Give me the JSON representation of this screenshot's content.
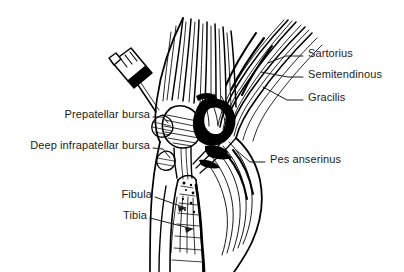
{
  "figure": {
    "background_color": "#ffffff",
    "ink_color": "#000000",
    "label_color": "#1b1b1b",
    "width": 404,
    "height": 272,
    "style": "black-and-white pen-and-ink line art"
  },
  "labels": {
    "sartorius": "Sartorius",
    "semitendinous": "Semitendinous",
    "gracilis": "Gracilis",
    "pes_anserinus": "Pes anserinus",
    "prepatellar_bursa": "Prepatellar bursa",
    "deep_infrapatellar_bursa": "Deep infrapatellar bursa",
    "fibula": "Fibula",
    "tibia": "Tibia"
  },
  "annotations": [
    {
      "id": "sartorius",
      "text": "Sartorius",
      "side": "right",
      "x": 308,
      "y": 52
    },
    {
      "id": "semitendinous",
      "text": "Semitendinous",
      "side": "right",
      "x": 308,
      "y": 73
    },
    {
      "id": "gracilis",
      "text": "Gracilis",
      "side": "right",
      "x": 308,
      "y": 96
    },
    {
      "id": "pes_anserinus",
      "text": "Pes anserinus",
      "side": "right",
      "x": 268,
      "y": 158
    },
    {
      "id": "prepatellar_bursa",
      "text": "Prepatellar bursa",
      "side": "left",
      "x": 60,
      "y": 113
    },
    {
      "id": "deep_infrapatellar_bursa",
      "text": "Deep infrapatellar bursa",
      "side": "left",
      "x": 20,
      "y": 144
    },
    {
      "id": "fibula",
      "text": "Fibula",
      "side": "left",
      "x": 120,
      "y": 193
    },
    {
      "id": "tibia",
      "text": "Tibia",
      "side": "left",
      "x": 123,
      "y": 214
    }
  ],
  "structures": [
    "quadriceps tendon fibers",
    "patella",
    "prepatellar bursa",
    "deep infrapatellar bursa",
    "patellar ligament",
    "sartorius tendon",
    "gracilis tendon",
    "semitendinosus tendon",
    "pes anserinus insertion",
    "gastrocnemius muscle belly",
    "tibial shaft",
    "fibular head",
    "syringe with needle"
  ]
}
